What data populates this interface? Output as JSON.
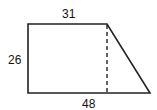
{
  "figure": {
    "shape": "trapezoid",
    "labels": {
      "top": "31",
      "left": "26",
      "bottom": "48"
    },
    "stroke_color": "#222222",
    "dashed_height_line": true
  }
}
